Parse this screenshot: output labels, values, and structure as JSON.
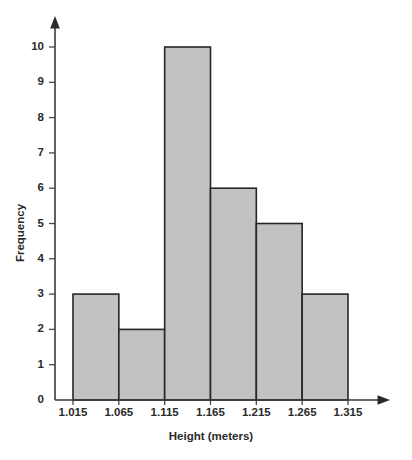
{
  "chart_data": {
    "type": "bar",
    "title": "",
    "subtitle": "",
    "xlabel": "Height (meters)",
    "ylabel": "Frequency",
    "categories": [
      "1.015-1.065",
      "1.065-1.115",
      "1.115-1.165",
      "1.165-1.215",
      "1.215-1.265",
      "1.265-1.315"
    ],
    "values": [
      3,
      2,
      10,
      6,
      5,
      3
    ],
    "bin_edges": [
      1.015,
      1.065,
      1.115,
      1.165,
      1.215,
      1.265,
      1.315
    ],
    "bin_width": 0.05,
    "x_tick_labels": [
      "1.015",
      "1.065",
      "1.115",
      "1.165",
      "1.215",
      "1.265",
      "1.315"
    ],
    "y_tick_labels": [
      "0",
      "1",
      "2",
      "3",
      "4",
      "5",
      "6",
      "7",
      "8",
      "9",
      "10"
    ],
    "y_tick_values": [
      0,
      1,
      2,
      3,
      4,
      5,
      6,
      7,
      8,
      9,
      10
    ],
    "xlim": [
      1.015,
      1.315
    ],
    "ylim": [
      0,
      10
    ],
    "grid": false,
    "legend": false,
    "legend_position": "none",
    "bar_fill_color": "#c2c2c2",
    "bar_edge_color": "#262626",
    "axis_color": "#3a3a3a",
    "text_color": "#2a2a2a",
    "background_color": "#ffffff"
  }
}
